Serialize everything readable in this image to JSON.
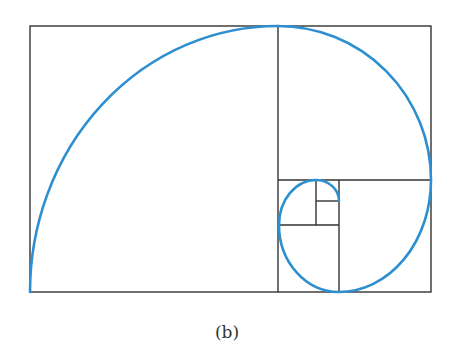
{
  "figure": {
    "caption": "(b)",
    "colors": {
      "spiral": "#2e8fd0",
      "lines": "#333333",
      "background": "#ffffff"
    },
    "outer_rect": {
      "x": 30,
      "y": 26,
      "width": 401,
      "height": 266
    },
    "divisions": [
      {
        "name": "big-square-divider",
        "x1": 278,
        "y1": 26,
        "x2": 278,
        "y2": 292
      },
      {
        "name": "top-right-square-divider",
        "x1": 278,
        "y1": 180,
        "x2": 431,
        "y2": 180
      },
      {
        "name": "bottom-right-square-divider",
        "x1": 339,
        "y1": 180,
        "x2": 339,
        "y2": 292
      },
      {
        "name": "bottom-small-square-divider",
        "x1": 279,
        "y1": 225,
        "x2": 339,
        "y2": 225
      },
      {
        "name": "left-small-square-divider",
        "x1": 316,
        "y1": 180,
        "x2": 316,
        "y2": 225
      },
      {
        "name": "tiny-square-divider",
        "x1": 316,
        "y1": 201,
        "x2": 339,
        "y2": 201
      }
    ],
    "spiral_path": "M30,292 A248,266 0 0 1 278,26 A153,154 0 0 1 431,180 A92,112 0 0 1 339,292 A60,67 0 0 1 279,225 A37,45 0 0 1 316,180 A23,21 0 0 1 339,201"
  }
}
